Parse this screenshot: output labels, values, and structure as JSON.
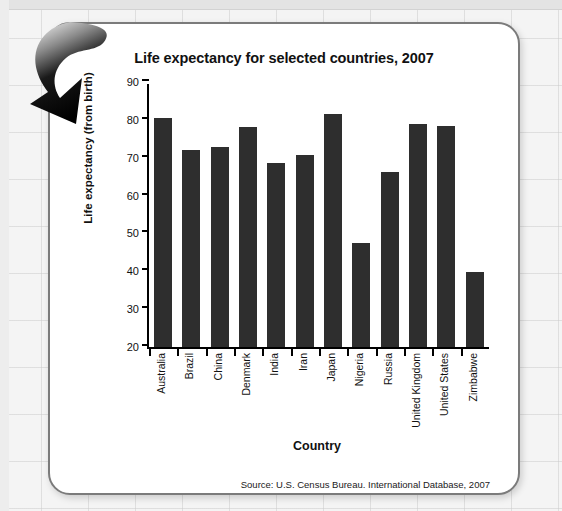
{
  "slide": {
    "source_note": "Source:  U.S. Census Bureau. International Database, 2007",
    "arrow_icon": "curved-down-right-arrow-icon"
  },
  "chart_data": {
    "type": "bar",
    "title": "Life expectancy for selected countries, 2007",
    "xlabel": "Country",
    "ylabel": "Life expectancy (from birth)",
    "ylim": [
      20,
      90
    ],
    "yticks": [
      20,
      30,
      40,
      50,
      60,
      70,
      80,
      90
    ],
    "grid": false,
    "legend": null,
    "bar_color": "#2e2e2e",
    "categories": [
      "Australia",
      "Brazil",
      "China",
      "Denmark",
      "India",
      "Iran",
      "Japan",
      "Nigeria",
      "Russia",
      "United Kingdom",
      "United States",
      "Zimbabwe"
    ],
    "values": [
      80.6,
      72.0,
      72.9,
      78.0,
      68.6,
      70.6,
      81.6,
      47.6,
      66.2,
      78.8,
      78.3,
      39.7
    ]
  }
}
